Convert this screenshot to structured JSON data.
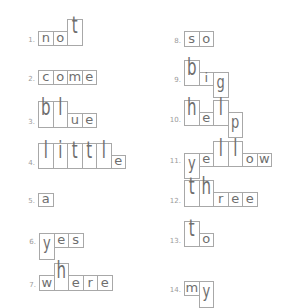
{
  "worksheet": {
    "cell_width": 14.5,
    "items": [
      {
        "number": "1.",
        "word": "not",
        "x": 38,
        "top": 31,
        "bottom": 45,
        "shapes": [
          "s",
          "s",
          "t"
        ]
      },
      {
        "number": "2.",
        "word": "come",
        "x": 38,
        "top": 70,
        "bottom": 84,
        "shapes": [
          "s",
          "s",
          "s",
          "s"
        ]
      },
      {
        "number": "3.",
        "word": "blue",
        "x": 38,
        "top": 113,
        "bottom": 127,
        "shapes": [
          "t",
          "t",
          "s",
          "s"
        ]
      },
      {
        "number": "4.",
        "word": "little",
        "x": 38,
        "top": 155,
        "bottom": 168,
        "shapes": [
          "t",
          "t",
          "t",
          "t",
          "t",
          "s"
        ]
      },
      {
        "number": "5.",
        "word": "a",
        "x": 38,
        "top": 193,
        "bottom": 206,
        "shapes": [
          "s"
        ]
      },
      {
        "number": "6.",
        "word": "yes",
        "x": 39,
        "top": 233,
        "bottom": 247,
        "shapes": [
          "d",
          "s",
          "s"
        ]
      },
      {
        "number": "7.",
        "word": "where",
        "x": 39,
        "top": 275,
        "bottom": 290,
        "shapes": [
          "s",
          "t",
          "s",
          "s",
          "s"
        ]
      },
      {
        "number": "8.",
        "word": "so",
        "x": 184,
        "top": 31,
        "bottom": 46,
        "shapes": [
          "s",
          "s"
        ]
      },
      {
        "number": "9.",
        "word": "big",
        "x": 184,
        "top": 72,
        "bottom": 85,
        "shapes": [
          "t",
          "s",
          "d"
        ]
      },
      {
        "number": "10.",
        "word": "help",
        "x": 184,
        "top": 112,
        "bottom": 125,
        "shapes": [
          "t",
          "s",
          "t",
          "d"
        ]
      },
      {
        "number": "11.",
        "word": "yellow",
        "x": 184,
        "top": 153,
        "bottom": 166,
        "shapes": [
          "d",
          "s",
          "t",
          "t",
          "s",
          "s"
        ]
      },
      {
        "number": "12.",
        "word": "three",
        "x": 184,
        "top": 192,
        "bottom": 206,
        "shapes": [
          "t",
          "t",
          "s",
          "s",
          "s"
        ]
      },
      {
        "number": "13.",
        "word": "to",
        "x": 184,
        "top": 233,
        "bottom": 246,
        "shapes": [
          "t",
          "s"
        ]
      },
      {
        "number": "14.",
        "word": "my",
        "x": 184,
        "top": 281,
        "bottom": 295,
        "shapes": [
          "s",
          "d"
        ]
      }
    ]
  }
}
